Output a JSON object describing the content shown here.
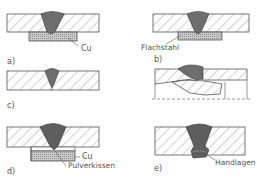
{
  "figure": {
    "panels": [
      {
        "id": "a",
        "label": "a)",
        "annotations": [
          "Cu"
        ]
      },
      {
        "id": "b",
        "label": "b)",
        "annotations": [
          "Flachstahl"
        ]
      },
      {
        "id": "c",
        "label": "c)",
        "annotations": []
      },
      {
        "id": "d",
        "label": "d)",
        "annotations": [
          "Cu",
          "Pulverkissen"
        ]
      },
      {
        "id": "e",
        "label": "e)",
        "annotations": [
          "Handlagen"
        ]
      }
    ]
  },
  "colors": {
    "line": "#555555",
    "weld": "#6e6e6e",
    "backing": "#b5b5b5"
  }
}
